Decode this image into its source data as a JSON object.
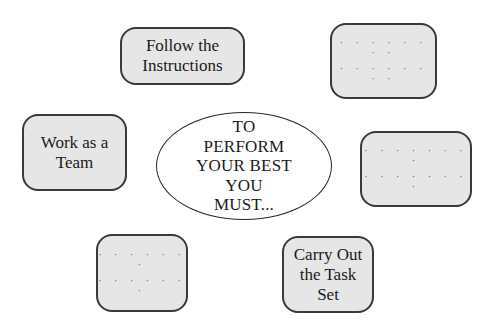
{
  "diagram": {
    "center": {
      "text": "TO\nPERFORM\nYOUR BEST\nYOU\nMUST..."
    },
    "boxes": [
      {
        "id": "follow-instructions",
        "text": "Follow the\nInstructions"
      },
      {
        "id": "blank-top-right",
        "dots": [
          "· · · · · · · ·",
          "· · · · · · · ·"
        ]
      },
      {
        "id": "work-as-team",
        "text": "Work as a\nTeam"
      },
      {
        "id": "blank-right",
        "dots": [
          "· · · · · · · ·",
          "· · · · · · · ·"
        ]
      },
      {
        "id": "blank-bottom-left",
        "dots": [
          "· · · · · · ·",
          "· · · · · · ·"
        ]
      },
      {
        "id": "carry-out-task",
        "text": "Carry Out\nthe Task\nSet"
      }
    ],
    "colors": {
      "box_fill": "#e6e6e6",
      "box_border": "#3a3a3a",
      "ellipse_fill": "#ffffff",
      "text": "#1a1a1a"
    }
  }
}
